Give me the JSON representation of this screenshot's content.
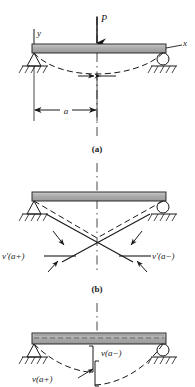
{
  "figure": {
    "panels": [
      {
        "id": "a",
        "caption": "(a)",
        "load_label": "P",
        "axis_y_label": "y",
        "axis_x_label": "x",
        "dimension_label": "a",
        "supports": [
          "pin-support",
          "roller-support"
        ],
        "description": "Simply supported beam with concentrated load P at distance a from left support; dashed curve shows deflected shape"
      },
      {
        "id": "b",
        "caption": "(b)",
        "slope_left_label": "v'(a+)",
        "slope_right_label": "v'(a−)",
        "supports": [
          "pin-support",
          "roller-support"
        ],
        "description": "Slope discontinuity at x = a shown by two crossing tangent lines"
      },
      {
        "id": "c",
        "caption": "(c)",
        "deflection_upper_label": "v(a−)",
        "deflection_lower_label": "v(a+)",
        "supports": [
          "pin-support",
          "roller-support"
        ],
        "description": "Deflection discontinuity at x = a shown by offset bracket between the two dashed curves"
      }
    ]
  },
  "colors": {
    "beam_fill": "#a8a8a8",
    "beam_fill_light": "#c9c9c9",
    "line": "#1a1a1a",
    "background": "#ffffff"
  }
}
